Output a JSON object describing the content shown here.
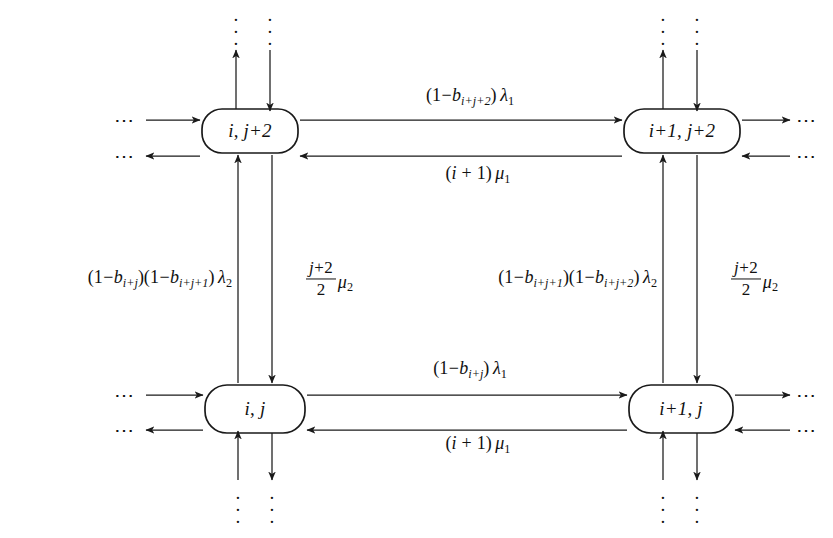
{
  "figure": {
    "type": "state-transition-diagram",
    "background_color": "#ffffff",
    "line_color": "#1a1a1a"
  },
  "nodes": [
    {
      "id": "top-left",
      "label": "i, j+2",
      "label_parts": {
        "first": "i",
        "comma": ",",
        "second": "j+2"
      },
      "x": 250,
      "y": 131,
      "w": 96,
      "h": 44
    },
    {
      "id": "top-right",
      "label": "i+1, j+2",
      "label_parts": {
        "first": "i+1",
        "comma": ",",
        "second": "j+2"
      },
      "x": 682,
      "y": 131,
      "w": 116,
      "h": 44
    },
    {
      "id": "bottom-left",
      "label": "i, j",
      "label_parts": {
        "first": "i",
        "comma": ",",
        "second": "j"
      },
      "x": 255,
      "y": 409,
      "w": 100,
      "h": 48
    },
    {
      "id": "bottom-right",
      "label": "i+1, j",
      "label_parts": {
        "first": "i+1",
        "comma": ",",
        "second": "j"
      },
      "x": 681,
      "y": 409,
      "w": 104,
      "h": 48
    }
  ],
  "edge_labels": {
    "top_lambda1": {
      "text": "(1-b_{i+j+2}) λ1",
      "x": 470,
      "y": 97,
      "rate": "lambda_1",
      "coefficient": "(1-b_{i+j+2})"
    },
    "top_mu1": {
      "text": "(i+1) μ1",
      "x": 478,
      "y": 175,
      "rate": "mu_1",
      "coefficient": "(i+1)"
    },
    "bottom_lambda1": {
      "text": "(1-b_{i+j}) λ1",
      "x": 470,
      "y": 370,
      "rate": "lambda_1",
      "coefficient": "(1-b_{i+j})"
    },
    "bottom_mu1": {
      "text": "(i+1) μ1",
      "x": 478,
      "y": 445,
      "rate": "mu_1",
      "coefficient": "(i+1)"
    },
    "left_lambda2": {
      "text": "(1-b_{i+j})(1-b_{i+j+1}) λ2",
      "x": 225,
      "y": 279,
      "rate": "lambda_2",
      "coefficient": "(1-b_{i+j})(1-b_{i+j+1})"
    },
    "left_mu2": {
      "text": "((j+2)/2) μ2",
      "x": 298,
      "y": 279,
      "rate": "mu_2",
      "coefficient": "(j+2)/2"
    },
    "mid_lambda2": {
      "text": "(1-b_{i+j+1})(1-b_{i+j+2}) λ2",
      "x": 537,
      "y": 279,
      "rate": "lambda_2",
      "coefficient": "(1-b_{i+j+1})(1-b_{i+j+2})"
    },
    "right_mu2": {
      "text": "((j+2)/2) μ2",
      "x": 727,
      "y": 279,
      "rate": "mu_2",
      "coefficient": "(j+2)/2"
    }
  },
  "ellipses": {
    "left_top_in": {
      "x": 126,
      "y": 120
    },
    "left_top_out": {
      "x": 126,
      "y": 156
    },
    "left_bottom_in": {
      "x": 126,
      "y": 395
    },
    "left_bottom_out": {
      "x": 126,
      "y": 430
    },
    "right_top_out": {
      "x": 806,
      "y": 120
    },
    "right_top_in": {
      "x": 806,
      "y": 156
    },
    "right_bottom_out": {
      "x": 806,
      "y": 395
    },
    "right_bottom_in": {
      "x": 806,
      "y": 430
    },
    "top_left_col": {
      "x": 236,
      "y": 16
    },
    "top_left_col2": {
      "x": 270,
      "y": 16
    },
    "top_right_col": {
      "x": 663,
      "y": 16
    },
    "top_right_col2": {
      "x": 697,
      "y": 16
    },
    "bot_left_col": {
      "x": 238,
      "y": 496
    },
    "bot_left_col2": {
      "x": 272,
      "y": 496
    },
    "bot_right_col": {
      "x": 663,
      "y": 496
    },
    "bot_right_col2": {
      "x": 697,
      "y": 496
    },
    "glyph": "⋯",
    "vglyph": "·"
  },
  "symbols": {
    "lambda": "λ",
    "mu": "μ",
    "b": "b",
    "i": "i",
    "j": "j",
    "minus": "−",
    "plus": "+",
    "one": "1",
    "two": "2"
  }
}
